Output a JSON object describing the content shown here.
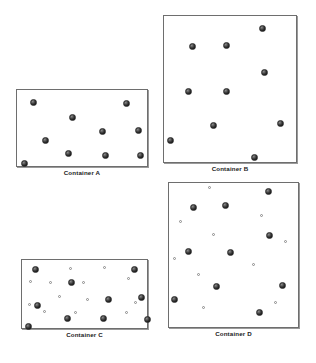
{
  "figure": {
    "background_color": "#ffffff",
    "box_border_color": "#6e6e6e",
    "large_particle_color": "#1c1c1c",
    "small_particle_color": "#ffffff",
    "small_particle_border_color": "#8a8a8a"
  },
  "containers": [
    {
      "id": "a",
      "label": "Container A",
      "box": {
        "x": 16,
        "y": 89,
        "width": 132,
        "height": 78
      },
      "caption": {
        "x": 16,
        "y": 169,
        "width": 132
      },
      "large_particle_count": 9,
      "small_particle_count": 0,
      "large_particles": [
        {
          "x": 14,
          "y": 10
        },
        {
          "x": 107,
          "y": 11
        },
        {
          "x": 53,
          "y": 25
        },
        {
          "x": 83,
          "y": 39
        },
        {
          "x": 119,
          "y": 38
        },
        {
          "x": 26,
          "y": 48
        },
        {
          "x": 49,
          "y": 61
        },
        {
          "x": 86,
          "y": 63
        },
        {
          "x": 121,
          "y": 63
        },
        {
          "x": 5,
          "y": 71
        }
      ],
      "small_particles": []
    },
    {
      "id": "b",
      "label": "Container B",
      "box": {
        "x": 163,
        "y": 15,
        "width": 134,
        "height": 148
      },
      "caption": {
        "x": 163,
        "y": 165,
        "width": 134
      },
      "large_particle_count": 9,
      "small_particle_count": 0,
      "large_particles": [
        {
          "x": 96,
          "y": 10
        },
        {
          "x": 26,
          "y": 28
        },
        {
          "x": 60,
          "y": 27
        },
        {
          "x": 98,
          "y": 54
        },
        {
          "x": 22,
          "y": 73
        },
        {
          "x": 60,
          "y": 73
        },
        {
          "x": 47,
          "y": 107
        },
        {
          "x": 114,
          "y": 105
        },
        {
          "x": 4,
          "y": 122
        },
        {
          "x": 88,
          "y": 139
        }
      ],
      "small_particles": []
    },
    {
      "id": "c",
      "label": "Container C",
      "box": {
        "x": 21,
        "y": 259,
        "width": 127,
        "height": 70
      },
      "caption": {
        "x": 21,
        "y": 331,
        "width": 127
      },
      "large_particle_count": 10,
      "small_particle_count": 13,
      "large_particles": [
        {
          "x": 11,
          "y": 7
        },
        {
          "x": 110,
          "y": 7
        },
        {
          "x": 47,
          "y": 20
        },
        {
          "x": 84,
          "y": 37
        },
        {
          "x": 117,
          "y": 35
        },
        {
          "x": 13,
          "y": 43
        },
        {
          "x": 43,
          "y": 56
        },
        {
          "x": 79,
          "y": 56
        },
        {
          "x": 123,
          "y": 57
        },
        {
          "x": 4,
          "y": 64
        }
      ],
      "small_particles": [
        {
          "x": 48,
          "y": 8
        },
        {
          "x": 82,
          "y": 7
        },
        {
          "x": 106,
          "y": 18
        },
        {
          "x": 8,
          "y": 21
        },
        {
          "x": 28,
          "y": 22
        },
        {
          "x": 61,
          "y": 22
        },
        {
          "x": 37,
          "y": 36
        },
        {
          "x": 65,
          "y": 39
        },
        {
          "x": 7,
          "y": 44
        },
        {
          "x": 22,
          "y": 51
        },
        {
          "x": 53,
          "y": 52
        },
        {
          "x": 104,
          "y": 52
        },
        {
          "x": 113,
          "y": 42
        }
      ]
    },
    {
      "id": "d",
      "label": "Container D",
      "box": {
        "x": 168,
        "y": 182,
        "width": 131,
        "height": 146
      },
      "caption": {
        "x": 168,
        "y": 330,
        "width": 131
      },
      "large_particle_count": 10,
      "small_particle_count": 13,
      "large_particles": [
        {
          "x": 97,
          "y": 6
        },
        {
          "x": 22,
          "y": 22
        },
        {
          "x": 54,
          "y": 20
        },
        {
          "x": 98,
          "y": 50
        },
        {
          "x": 17,
          "y": 66
        },
        {
          "x": 59,
          "y": 67
        },
        {
          "x": 45,
          "y": 101
        },
        {
          "x": 111,
          "y": 100
        },
        {
          "x": 3,
          "y": 114
        },
        {
          "x": 88,
          "y": 127
        }
      ],
      "small_particles": [
        {
          "x": 40,
          "y": 4
        },
        {
          "x": 92,
          "y": 32
        },
        {
          "x": 11,
          "y": 38
        },
        {
          "x": 44,
          "y": 51
        },
        {
          "x": 116,
          "y": 58
        },
        {
          "x": 5,
          "y": 75
        },
        {
          "x": 84,
          "y": 81
        },
        {
          "x": 29,
          "y": 91
        },
        {
          "x": 106,
          "y": 119
        },
        {
          "x": 34,
          "y": 124
        }
      ]
    }
  ]
}
